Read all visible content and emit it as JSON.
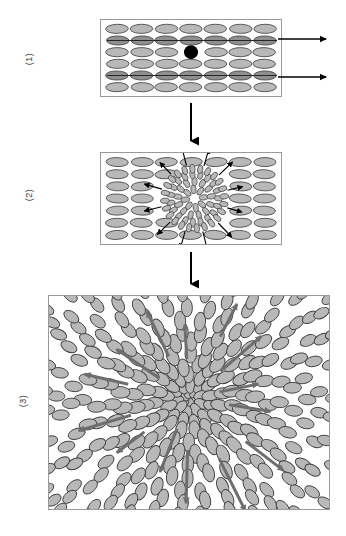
{
  "figure": {
    "type": "diagram",
    "title": "",
    "background_color": "#ffffff",
    "panel_border_color": "#9a9a9a"
  },
  "colors": {
    "ellipse_fill_light": "#b8b8b8",
    "ellipse_fill_dark": "#8f8f8f",
    "ellipse_stroke": "#3c3c3c",
    "nucleus_fill": "#000000",
    "arrow_black": "#000000",
    "arrow_gray": "#6e6e6e",
    "label_color": "#3a3a3a"
  },
  "stages": [
    {
      "id": "stage-1",
      "label": "(1)",
      "caption": "",
      "frame": {
        "x": 100,
        "y": 19,
        "width": 182,
        "height": 78
      },
      "lattice": {
        "rows": 6,
        "cols": 7,
        "orientation_deg": 0
      },
      "dark_rows": [
        2,
        5
      ],
      "nucleus": {
        "row": 3,
        "col": 4,
        "radius": 7,
        "shape": "circle"
      },
      "exit_arrows": [
        {
          "row": 2,
          "direction": "right",
          "length": 46
        },
        {
          "row": 5,
          "direction": "right",
          "length": 46
        }
      ]
    },
    {
      "id": "stage-2",
      "label": "(2)",
      "caption": "",
      "frame": {
        "x": 100,
        "y": 152,
        "width": 182,
        "height": 93
      },
      "lattice": {
        "rows": 7,
        "cols": 7,
        "orientation_deg": 0
      },
      "cluster": {
        "cx": 0.52,
        "cy": 0.5,
        "radius": 31,
        "rings": 4,
        "petals": 60
      },
      "radial_arrows": 12
    },
    {
      "id": "stage-3",
      "label": "(3)",
      "caption": "",
      "frame": {
        "x": 48,
        "y": 295,
        "width": 282,
        "height": 215
      },
      "texture": {
        "type": "radial-splay",
        "rings": 13,
        "core_radius": 8
      },
      "radial_arrows": 14
    }
  ],
  "connectors": [
    {
      "id": "connector-1-2",
      "from": "stage-1",
      "to": "stage-2",
      "x": 191,
      "y1": 103,
      "y2": 147,
      "direction": "down"
    },
    {
      "id": "connector-2-3",
      "from": "stage-2",
      "to": "stage-3",
      "x": 191,
      "y1": 252,
      "y2": 290,
      "direction": "down"
    }
  ]
}
